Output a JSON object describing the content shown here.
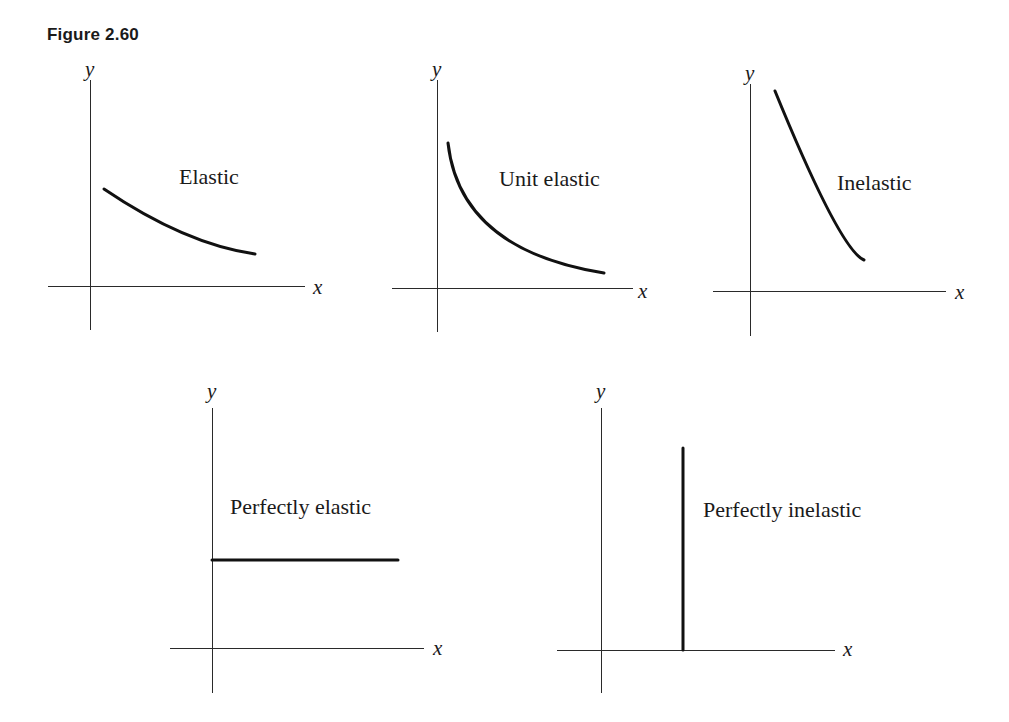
{
  "figure": {
    "title": "Figure 2.60"
  },
  "colors": {
    "ink": "#111111",
    "axis": "#2a2a2a",
    "background": "#ffffff"
  },
  "panels": [
    {
      "id": "elastic",
      "label": "Elastic",
      "x_axis_label": "x",
      "y_axis_label": "y",
      "origin": [
        90,
        286
      ],
      "x_axis": [
        48,
        305
      ],
      "y_axis": [
        80,
        330
      ],
      "y_label_pos": [
        85,
        76
      ],
      "x_label_pos": [
        313,
        294
      ],
      "label_pos": [
        179,
        184
      ],
      "curve_path": "M104 189 Q 185 244 255 254"
    },
    {
      "id": "unit-elastic",
      "label": "Unit elastic",
      "x_axis_label": "x",
      "y_axis_label": "y",
      "origin": [
        437,
        288
      ],
      "x_axis": [
        392,
        633
      ],
      "y_axis": [
        80,
        332
      ],
      "y_label_pos": [
        432,
        76
      ],
      "x_label_pos": [
        638,
        298
      ],
      "label_pos": [
        499,
        186
      ],
      "curve_path": "M448 143 Q 460 250 604 273"
    },
    {
      "id": "inelastic",
      "label": "Inelastic",
      "x_axis_label": "x",
      "y_axis_label": "y",
      "origin": [
        750,
        291
      ],
      "x_axis": [
        713,
        946
      ],
      "y_axis": [
        84,
        336
      ],
      "y_label_pos": [
        745,
        80
      ],
      "x_label_pos": [
        955,
        299
      ],
      "label_pos": [
        837,
        190
      ],
      "curve_path": "M775 91 Q 840 250 864 260"
    },
    {
      "id": "perfectly-elastic",
      "label": "Perfectly elastic",
      "x_axis_label": "x",
      "y_axis_label": "y",
      "origin": [
        212,
        648
      ],
      "x_axis": [
        170,
        424
      ],
      "y_axis": [
        408,
        693
      ],
      "y_label_pos": [
        207,
        398
      ],
      "x_label_pos": [
        433,
        655
      ],
      "label_pos": [
        230,
        514
      ],
      "curve_path": "M212 560 L 398 560"
    },
    {
      "id": "perfectly-inelastic",
      "label": "Perfectly inelastic",
      "x_axis_label": "x",
      "y_axis_label": "y",
      "origin": [
        601,
        650
      ],
      "x_axis": [
        557,
        835
      ],
      "y_axis": [
        408,
        693
      ],
      "y_label_pos": [
        596,
        398
      ],
      "x_label_pos": [
        843,
        656
      ],
      "label_pos": [
        703,
        517
      ],
      "curve_path": "M683 448 L 683 650"
    }
  ],
  "chart_data": [
    {
      "type": "line",
      "title": "Elastic",
      "xlabel": "x",
      "ylabel": "y",
      "grid": false,
      "description": "Gently downward-sloping convex demand curve (elasticity > 1)",
      "x": [
        0.08,
        0.3,
        0.5,
        0.7,
        0.85
      ],
      "y": [
        0.48,
        0.38,
        0.27,
        0.19,
        0.16
      ],
      "xlim": [
        0,
        1
      ],
      "ylim": [
        0,
        1
      ]
    },
    {
      "type": "line",
      "title": "Unit elastic",
      "xlabel": "x",
      "ylabel": "y",
      "grid": false,
      "description": "Rectangular hyperbola (elasticity = 1), steep near y-axis flattening to the right",
      "x": [
        0.06,
        0.1,
        0.2,
        0.4,
        0.6,
        0.85
      ],
      "y": [
        0.72,
        0.5,
        0.33,
        0.2,
        0.12,
        0.07
      ],
      "xlim": [
        0,
        1
      ],
      "ylim": [
        0,
        1
      ]
    },
    {
      "type": "line",
      "title": "Inelastic",
      "xlabel": "x",
      "ylabel": "y",
      "grid": false,
      "description": "Steep downward-sloping demand curve (elasticity < 1)",
      "x": [
        0.13,
        0.2,
        0.3,
        0.4,
        0.5
      ],
      "y": [
        0.98,
        0.78,
        0.55,
        0.3,
        0.15
      ],
      "xlim": [
        0,
        1
      ],
      "ylim": [
        0,
        1
      ]
    },
    {
      "type": "line",
      "title": "Perfectly elastic",
      "xlabel": "x",
      "ylabel": "y",
      "grid": false,
      "description": "Horizontal demand line starting at the y-axis (infinite elasticity)",
      "x": [
        0,
        0.88
      ],
      "y": [
        0.37,
        0.37
      ],
      "xlim": [
        0,
        1
      ],
      "ylim": [
        0,
        1
      ]
    },
    {
      "type": "line",
      "title": "Perfectly inelastic",
      "xlabel": "x",
      "ylabel": "y",
      "grid": false,
      "description": "Vertical demand line rising from the x-axis (zero elasticity)",
      "x": [
        0.35,
        0.35
      ],
      "y": [
        0,
        0.85
      ],
      "xlim": [
        0,
        1
      ],
      "ylim": [
        0,
        1
      ]
    }
  ]
}
